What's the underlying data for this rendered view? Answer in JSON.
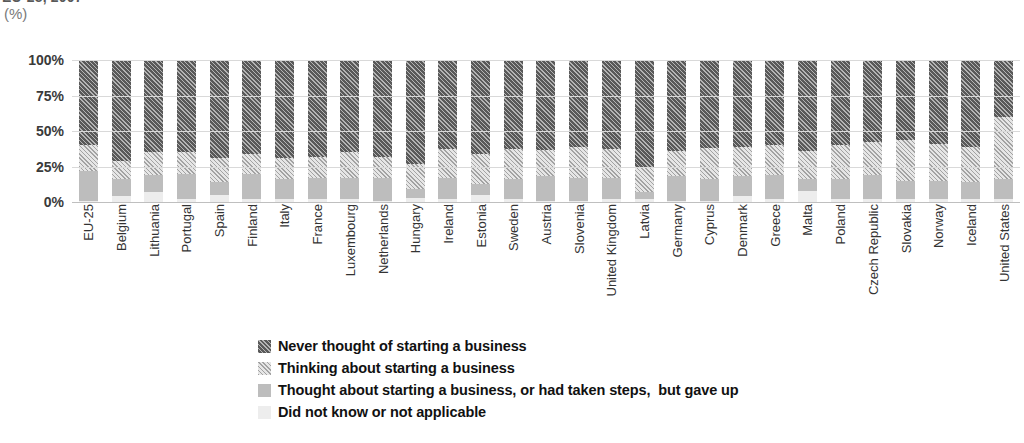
{
  "title_clipped": "EU-25, 2007",
  "unit_label": "(%)",
  "legend": [
    {
      "key": "never",
      "label": "Never thought of starting a business",
      "swatch": "dark-hatched-swatch",
      "color": "#595959"
    },
    {
      "key": "thinking",
      "label": "Thinking about starting a business",
      "swatch": "light-hatched-swatch",
      "color": "#e6e6e6"
    },
    {
      "key": "gaveup",
      "label": "Thought about starting a business, or had taken steps,  but gave up",
      "swatch": "medium-grey-swatch",
      "color": "#bdbdbd"
    },
    {
      "key": "dontknow",
      "label": "Did not know or not applicable",
      "swatch": "light-grey-swatch",
      "color": "#ededed"
    }
  ],
  "chart_data": {
    "type": "bar",
    "stacked": true,
    "stack_mode": "percent",
    "title": "EU-25, 2007",
    "xlabel": "",
    "ylabel": "(%)",
    "ylim": [
      0,
      100
    ],
    "yticks": [
      "0%",
      "25%",
      "50%",
      "75%",
      "100%"
    ],
    "ytick_values": [
      0,
      25,
      50,
      75,
      100
    ],
    "grid": true,
    "legend_position": "bottom-center",
    "categories": [
      "EU-25",
      "Belgium",
      "Lithuania",
      "Portugal",
      "Spain",
      "Finland",
      "Italy",
      "France",
      "Luxembourg",
      "Netherlands",
      "Hungary",
      "Ireland",
      "Estonia",
      "Sweden",
      "Austria",
      "Slovenia",
      "United Kingdom",
      "Latvia",
      "Germany",
      "Cyprus",
      "Denmark",
      "Greece",
      "Malta",
      "Poland",
      "Czech Republic",
      "Slovakia",
      "Norway",
      "Iceland",
      "United States"
    ],
    "series": [
      {
        "name": "Did not know or not applicable",
        "key": "dontknow",
        "values": [
          1,
          4,
          7,
          2,
          5,
          2,
          2,
          2,
          2,
          1,
          3,
          2,
          5,
          2,
          1,
          1,
          2,
          2,
          1,
          1,
          4,
          2,
          8,
          2,
          2,
          2,
          2,
          2,
          2
        ]
      },
      {
        "name": "Thought about starting a business, or had taken steps,  but gave up",
        "key": "gaveup",
        "values": [
          21,
          12,
          12,
          18,
          9,
          18,
          14,
          15,
          15,
          16,
          6,
          15,
          8,
          14,
          17,
          16,
          15,
          5,
          17,
          15,
          14,
          17,
          8,
          14,
          17,
          13,
          13,
          12,
          14
        ]
      },
      {
        "name": "Thinking about starting a business",
        "key": "thinking",
        "values": [
          18,
          13,
          16,
          15,
          17,
          14,
          15,
          15,
          18,
          15,
          18,
          20,
          21,
          21,
          19,
          22,
          20,
          18,
          18,
          22,
          21,
          21,
          20,
          24,
          23,
          29,
          26,
          25,
          44
        ]
      },
      {
        "name": "Never thought of starting a business",
        "key": "never",
        "values": [
          60,
          71,
          65,
          65,
          69,
          66,
          69,
          68,
          65,
          68,
          73,
          63,
          66,
          63,
          63,
          61,
          63,
          75,
          64,
          62,
          61,
          60,
          64,
          60,
          58,
          56,
          59,
          61,
          40
        ]
      }
    ]
  }
}
